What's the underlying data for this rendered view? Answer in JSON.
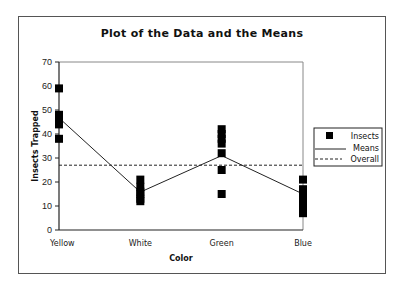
{
  "chart_data": {
    "type": "scatter",
    "title": "Plot of the Data and the Means",
    "xlabel": "Color",
    "ylabel": "Insects Trapped",
    "categories": [
      "Yellow",
      "White",
      "Green",
      "Blue"
    ],
    "ylim": [
      0,
      70
    ],
    "yticks": [
      0,
      10,
      20,
      30,
      40,
      50,
      60,
      70
    ],
    "grid": false,
    "legend_position": "right",
    "series": [
      {
        "name": "Insects",
        "style": "square-markers",
        "points": {
          "Yellow": [
            59,
            48,
            47,
            46,
            45,
            44,
            38
          ],
          "White": [
            21,
            18,
            16,
            15,
            13,
            12
          ],
          "Green": [
            42,
            40,
            38,
            36,
            32,
            25,
            15
          ],
          "Blue": [
            21,
            17,
            15,
            13,
            11,
            9,
            7
          ]
        }
      },
      {
        "name": "Means",
        "style": "solid-line",
        "values": [
          46.7,
          15.8,
          31,
          15
        ]
      },
      {
        "name": "Overall",
        "style": "dashed-line",
        "value": 27
      }
    ]
  },
  "legend": {
    "items": [
      {
        "label": "Insects"
      },
      {
        "label": "Means"
      },
      {
        "label": "Overall"
      }
    ]
  }
}
